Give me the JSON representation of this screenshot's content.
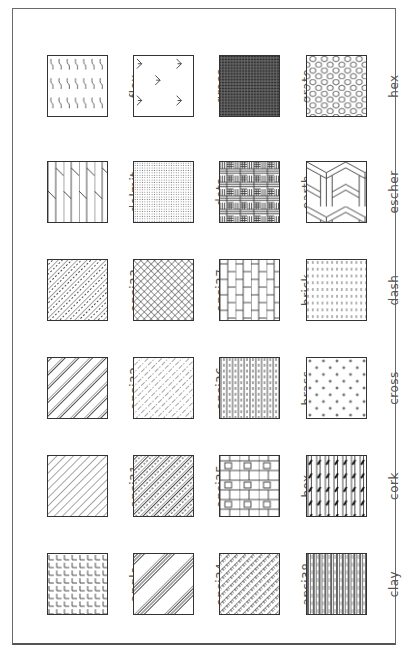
{
  "orientation": "rotated -90deg (labels read bottom-to-top)",
  "colors": {
    "line": "#333333",
    "label": "#555555",
    "frame": "#6a6a6a",
    "background": "#ffffff"
  },
  "grid": {
    "columns_x": [
      47,
      133,
      219,
      306
    ],
    "rows_y": [
      55,
      161,
      259,
      357,
      455,
      553
    ],
    "rows": [
      [
        {
          "name": "flex",
          "pattern": "flex"
        },
        {
          "name": "grass",
          "pattern": "grass"
        },
        {
          "name": "grate",
          "pattern": "grate"
        },
        {
          "name": "hex",
          "pattern": "hex"
        }
      ],
      [
        {
          "name": "dolmit",
          "pattern": "dolmit"
        },
        {
          "name": "dots",
          "pattern": "dots"
        },
        {
          "name": "earth",
          "pattern": "earth"
        },
        {
          "name": "escher",
          "pattern": "escher"
        }
      ],
      [
        {
          "name": "ansi33",
          "pattern": "ansi33"
        },
        {
          "name": "ansi37",
          "pattern": "ansi37"
        },
        {
          "name": "brick",
          "pattern": "brick"
        },
        {
          "name": "dash",
          "pattern": "dash"
        }
      ],
      [
        {
          "name": "ansi32",
          "pattern": "ansi32"
        },
        {
          "name": "ansi36",
          "pattern": "ansi36"
        },
        {
          "name": "brass",
          "pattern": "brass"
        },
        {
          "name": "cross",
          "pattern": "cross"
        }
      ],
      [
        {
          "name": "ansi31",
          "pattern": "ansi31"
        },
        {
          "name": "ansi35",
          "pattern": "ansi35"
        },
        {
          "name": "box",
          "pattern": "box"
        },
        {
          "name": "cork",
          "pattern": "cork"
        }
      ],
      [
        {
          "name": "angle",
          "pattern": "angle"
        },
        {
          "name": "ansi34",
          "pattern": "ansi34"
        },
        {
          "name": "ansi38",
          "pattern": "ansi38"
        },
        {
          "name": "clay",
          "pattern": "clay"
        }
      ]
    ]
  }
}
